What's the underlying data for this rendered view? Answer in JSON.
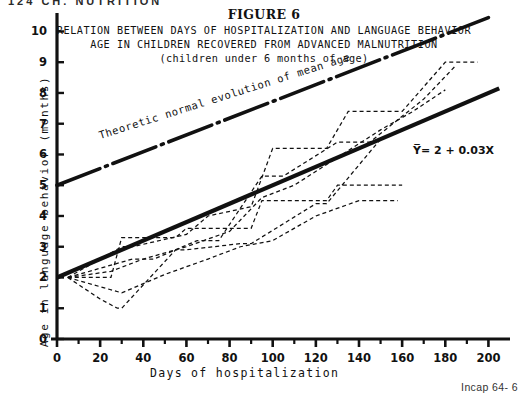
{
  "page": {
    "running_header": "124  CH.   NUTRITION",
    "footer_note": "Incap 64- 6"
  },
  "figure": {
    "number_label": "FIGURE 6",
    "title_line_1": "RELATION BETWEEN DAYS OF HOSPITALIZATION AND LANGUAGE BEHAVIOR",
    "title_line_2": "AGE IN CHILDREN RECOVERED FROM ADVANCED MALNUTRITION",
    "title_line_3": "(children under 6 months of age)"
  },
  "chart_data": {
    "type": "line",
    "title": "RELATION BETWEEN DAYS OF HOSPITALIZATION AND LANGUAGE BEHAVIOR AGE IN CHILDREN RECOVERED FROM ADVANCED MALNUTRITION (children under 6 months of age)",
    "xlabel": "Days of hospitalization",
    "ylabel": "Age in language behavior (months)",
    "xlim": [
      0,
      210
    ],
    "ylim": [
      0,
      10.6
    ],
    "grid": false,
    "legend_position": "none",
    "x_ticks": [
      0,
      20,
      40,
      60,
      80,
      100,
      120,
      140,
      160,
      180,
      200
    ],
    "x_tick_labels": [
      "0",
      "20",
      "40",
      "60",
      "80",
      "100",
      "120",
      "140",
      "160",
      "180",
      "200"
    ],
    "x_minor_tick_step": 10,
    "y_ticks": [
      0,
      1,
      2,
      3,
      4,
      5,
      6,
      7,
      8,
      9,
      10
    ],
    "y_tick_labels": [
      "0",
      "1",
      "2",
      "3",
      "4",
      "5",
      "6",
      "7",
      "8",
      "9",
      "10"
    ],
    "annotations": [
      {
        "name": "regression-equation",
        "text": "Y̅= 2 + 0.03X",
        "x": 165,
        "y": 6.0
      },
      {
        "name": "theoretic-line-label",
        "text": "Theoretic normal evolution of mean age",
        "x": 20,
        "y": 6.5,
        "rotation": -17.5
      }
    ],
    "series": [
      {
        "name": "Regression line (fitted)",
        "style": "solid-thick",
        "equation": "Y = 2 + 0.03X",
        "intercept": 2.0,
        "slope": 0.03,
        "x": [
          0,
          205
        ],
        "values": [
          2.0,
          8.15
        ]
      },
      {
        "name": "Theoretic normal evolution of mean age",
        "style": "dash-dot",
        "x": [
          0,
          200
        ],
        "values": [
          5.0,
          10.45
        ]
      },
      {
        "name": "Child 1",
        "style": "dashed",
        "x": [
          5,
          25,
          30,
          55,
          60,
          90,
          95,
          125,
          130,
          150,
          160
        ],
        "values": [
          2.0,
          2.0,
          3.3,
          3.3,
          3.6,
          3.6,
          4.5,
          4.5,
          5.0,
          5.0,
          5.0
        ]
      },
      {
        "name": "Child 2",
        "style": "dashed",
        "x": [
          5,
          20,
          28,
          30,
          55,
          60,
          85,
          90,
          120,
          125,
          150
        ],
        "values": [
          2.0,
          1.3,
          1.0,
          1.0,
          2.9,
          2.9,
          3.1,
          3.1,
          4.4,
          4.4,
          6.5
        ]
      },
      {
        "name": "Child 3",
        "style": "dashed",
        "x": [
          5,
          30,
          35,
          60,
          70,
          90,
          100,
          125,
          135,
          160,
          180,
          195
        ],
        "values": [
          2.0,
          3.0,
          3.0,
          3.4,
          4.0,
          4.3,
          6.2,
          6.2,
          7.4,
          7.4,
          9.0,
          9.0
        ]
      },
      {
        "name": "Child 4",
        "style": "dashed",
        "x": [
          5,
          35,
          45,
          65,
          75,
          95,
          105,
          130,
          145,
          170,
          185
        ],
        "values": [
          2.0,
          2.6,
          2.6,
          3.2,
          3.2,
          5.3,
          5.3,
          6.4,
          6.4,
          7.8,
          8.9
        ]
      },
      {
        "name": "Child 5",
        "style": "dashed",
        "x": [
          5,
          25,
          40,
          60,
          80,
          95,
          110,
          130,
          150,
          165,
          180
        ],
        "values": [
          2.0,
          2.2,
          2.6,
          3.0,
          3.5,
          4.6,
          5.0,
          5.9,
          6.8,
          7.4,
          8.1
        ]
      },
      {
        "name": "Child 6",
        "style": "dashed",
        "x": [
          5,
          30,
          50,
          70,
          85,
          100,
          120,
          140,
          158
        ],
        "values": [
          2.0,
          1.5,
          2.1,
          2.6,
          3.0,
          3.2,
          4.0,
          4.5,
          4.5
        ]
      }
    ]
  }
}
